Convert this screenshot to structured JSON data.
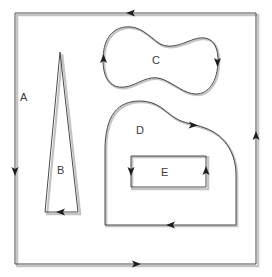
{
  "diagram": {
    "type": "oriented-regions",
    "regions": [
      {
        "id": "A",
        "label": "A",
        "shape": "outer-rectangle",
        "orientation": "counter-clockwise"
      },
      {
        "id": "B",
        "label": "B",
        "shape": "tall-triangle",
        "orientation": "counter-clockwise"
      },
      {
        "id": "C",
        "label": "C",
        "shape": "peanut-curve",
        "orientation": "clockwise"
      },
      {
        "id": "D",
        "label": "D",
        "shape": "rounded-region",
        "orientation": "clockwise"
      },
      {
        "id": "E",
        "label": "E",
        "shape": "inner-rectangle",
        "orientation": "counter-clockwise"
      }
    ],
    "colors": {
      "line": "#4a4a4a",
      "shadow": "#c4c4c4",
      "arrow": "#1e1e1e",
      "background": "#ffffff"
    }
  }
}
